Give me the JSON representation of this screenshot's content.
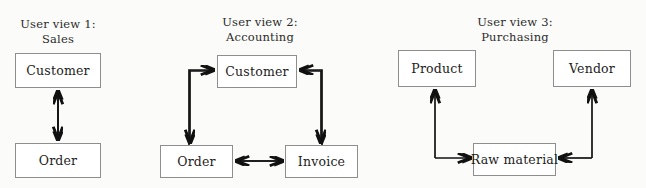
{
  "diagram": {
    "background_color": "#fbfbf9",
    "box_border_color": "#8e8e8e",
    "box_fill_color": "#ffffff",
    "arrow_color": "#111111",
    "views": [
      {
        "id": "view-1",
        "title_line1": "User view 1:",
        "title_line2": "Sales",
        "nodes": [
          {
            "id": "v1-customer",
            "label": "Customer"
          },
          {
            "id": "v1-order",
            "label": "Order"
          }
        ],
        "connections": [
          {
            "from": "Customer",
            "to": "Order",
            "style": "double-headed-vertical"
          }
        ]
      },
      {
        "id": "view-2",
        "title_line1": "User view 2:",
        "title_line2": "Accounting",
        "nodes": [
          {
            "id": "v2-customer",
            "label": "Customer"
          },
          {
            "id": "v2-order",
            "label": "Order"
          },
          {
            "id": "v2-invoice",
            "label": "Invoice"
          }
        ],
        "connections": [
          {
            "from": "Order",
            "to": "Customer",
            "style": "elbow-arrow"
          },
          {
            "from": "Customer",
            "to": "Order",
            "style": "elbow-arrow"
          },
          {
            "from": "Invoice",
            "to": "Customer",
            "style": "elbow-arrow"
          },
          {
            "from": "Customer",
            "to": "Invoice",
            "style": "elbow-arrow"
          },
          {
            "from": "Order",
            "to": "Invoice",
            "style": "double-headed-horizontal"
          }
        ]
      },
      {
        "id": "view-3",
        "title_line1": "User view 3:",
        "title_line2": "Purchasing",
        "nodes": [
          {
            "id": "v3-product",
            "label": "Product"
          },
          {
            "id": "v3-vendor",
            "label": "Vendor"
          },
          {
            "id": "v3-raw-material",
            "label": "Raw material"
          }
        ],
        "connections": [
          {
            "from": "Raw material",
            "to": "Product",
            "style": "elbow-arrow"
          },
          {
            "from": "Raw material",
            "to": "Vendor",
            "style": "elbow-arrow"
          }
        ]
      }
    ]
  }
}
